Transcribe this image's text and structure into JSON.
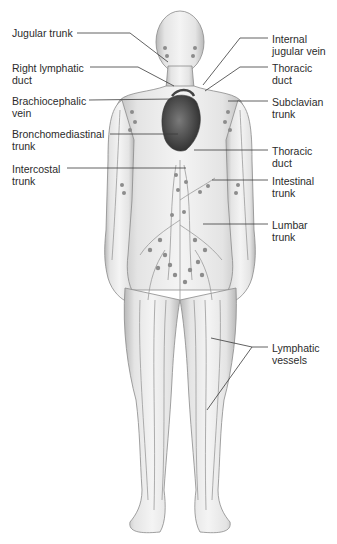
{
  "diagram": {
    "labels_left": [
      {
        "id": "jugular-trunk",
        "text": "Jugular trunk",
        "x": 12,
        "y": 27
      },
      {
        "id": "right-lymphatic-duct",
        "text": "Right lymphatic\nduct",
        "x": 12,
        "y": 62
      },
      {
        "id": "brachiocephalic-vein",
        "text": "Brachiocephalic\nvein",
        "x": 12,
        "y": 95
      },
      {
        "id": "bronchomediastinal-trunk",
        "text": "Bronchomediastinal\ntrunk",
        "x": 12,
        "y": 128
      },
      {
        "id": "intercostal-trunk",
        "text": "Intercostal\ntrunk",
        "x": 12,
        "y": 163
      }
    ],
    "labels_right": [
      {
        "id": "internal-jugular-vein",
        "text": "Internal\njugular vein",
        "x": 272,
        "y": 33
      },
      {
        "id": "thoracic-duct-upper",
        "text": "Thoracic\nduct",
        "x": 272,
        "y": 62
      },
      {
        "id": "subclavian-trunk",
        "text": "Subclavian\ntrunk",
        "x": 272,
        "y": 96
      },
      {
        "id": "thoracic-duct-lower",
        "text": "Thoracic\nduct",
        "x": 272,
        "y": 145
      },
      {
        "id": "intestinal-trunk",
        "text": "Intestinal\ntrunk",
        "x": 272,
        "y": 175
      },
      {
        "id": "lumbar-trunk",
        "text": "Lumbar\ntrunk",
        "x": 272,
        "y": 219
      },
      {
        "id": "lymphatic-vessels",
        "text": "Lymphatic\nvessels",
        "x": 272,
        "y": 342
      }
    ],
    "leader_color": "#3a3a3a",
    "body_fill": "#e6e6e6",
    "body_stroke": "#8a8a8a",
    "vessel_color": "#9a9a9a",
    "node_color": "#8c8c8c",
    "heart_color": "#4a4a4a"
  }
}
